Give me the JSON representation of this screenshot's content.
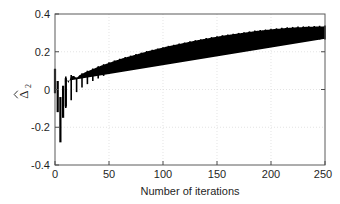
{
  "figure": {
    "background": "#ffffff",
    "plot_box": {
      "left": 55,
      "top": 14,
      "right": 325,
      "bottom": 165
    }
  },
  "chart_data": {
    "type": "line",
    "title": "",
    "subtitle": "",
    "xlabel": "Number of iterations",
    "ylabel": "Δ̂₂",
    "ylabel_base": "Δ",
    "ylabel_subscript": "2",
    "ylabel_accent": "hat",
    "xlim": [
      0,
      250
    ],
    "ylim": [
      -0.4,
      0.4
    ],
    "xticks": [
      0,
      50,
      100,
      150,
      200,
      250
    ],
    "xticklabels": [
      "0",
      "50",
      "100",
      "150",
      "200",
      "250"
    ],
    "yticks": [
      -0.4,
      -0.2,
      0,
      0.2,
      0.4
    ],
    "yticklabels": [
      "-0.4",
      "-0.2",
      "0",
      "0.2",
      "0.4"
    ],
    "grid": true,
    "grid_style": "dotted",
    "grid_color": "#d9d9d9",
    "legend": null,
    "legend_position": "none",
    "series_color": "#000000",
    "series": [
      {
        "name": "Delta-hat-2",
        "color": "#000000",
        "envelope_upper": [
          0.11,
          0.045,
          -0.04,
          0.02,
          0.06,
          0.035,
          0.07,
          0.072,
          0.06,
          0.075,
          0.082,
          0.09,
          0.096,
          0.102,
          0.108,
          0.114,
          0.12,
          0.126,
          0.131,
          0.136,
          0.141,
          0.146,
          0.151,
          0.156,
          0.16,
          0.165,
          0.169,
          0.173,
          0.177,
          0.181,
          0.185,
          0.189,
          0.193,
          0.197,
          0.201,
          0.205,
          0.208,
          0.212,
          0.215,
          0.219,
          0.222,
          0.226,
          0.229,
          0.232,
          0.235,
          0.238,
          0.241,
          0.244,
          0.247,
          0.25,
          0.253,
          0.256,
          0.259,
          0.262,
          0.264,
          0.267,
          0.27,
          0.272,
          0.275,
          0.277,
          0.28,
          0.282,
          0.285,
          0.287,
          0.289,
          0.291,
          0.293,
          0.295,
          0.297,
          0.299,
          0.301,
          0.303,
          0.305,
          0.307,
          0.309,
          0.311,
          0.312,
          0.314,
          0.315,
          0.317,
          0.318,
          0.32,
          0.321,
          0.322,
          0.324,
          0.325,
          0.326,
          0.327,
          0.328,
          0.329,
          0.33,
          0.33,
          0.331,
          0.332,
          0.332,
          0.333,
          0.333,
          0.334,
          0.334,
          0.334,
          0.335
        ],
        "envelope_lower": [
          -0.02,
          -0.12,
          -0.28,
          -0.15,
          -0.09,
          -0.11,
          -0.05,
          -0.03,
          -0.01,
          0.005,
          0.015,
          0.024,
          0.032,
          0.04,
          0.048,
          0.055,
          0.062,
          0.069,
          0.075,
          0.082,
          0.088,
          0.094,
          0.1,
          0.105,
          0.111,
          0.116,
          0.121,
          0.126,
          0.131,
          0.136,
          0.141,
          0.145,
          0.15,
          0.154,
          0.158,
          0.162,
          0.166,
          0.17,
          0.174,
          0.178,
          0.181,
          0.185,
          0.188,
          0.191,
          0.195,
          0.198,
          0.201,
          0.204,
          0.206,
          0.209,
          0.212,
          0.214,
          0.217,
          0.219,
          0.222,
          0.224,
          0.226,
          0.228,
          0.23,
          0.232,
          0.234,
          0.236,
          0.238,
          0.24,
          0.241,
          0.243,
          0.245,
          0.246,
          0.248,
          0.249,
          0.25,
          0.252,
          0.253,
          0.254,
          0.255,
          0.256,
          0.257,
          0.258,
          0.259,
          0.26,
          0.261,
          0.262,
          0.262,
          0.263,
          0.264,
          0.264,
          0.265,
          0.265,
          0.266,
          0.266,
          0.267,
          0.267,
          0.267,
          0.268,
          0.268,
          0.268,
          0.268,
          0.269,
          0.269,
          0.269
        ],
        "envelope_x": [
          0,
          2.5,
          5,
          7.5,
          10,
          12.5,
          15,
          17.5,
          20,
          22.5,
          25,
          27.5,
          30,
          32.5,
          35,
          37.5,
          40,
          42.5,
          45,
          47.5,
          50,
          52.5,
          55,
          57.5,
          60,
          62.5,
          65,
          67.5,
          70,
          72.5,
          75,
          77.5,
          80,
          82.5,
          85,
          87.5,
          90,
          92.5,
          95,
          97.5,
          100,
          102.5,
          105,
          107.5,
          110,
          112.5,
          115,
          117.5,
          120,
          122.5,
          125,
          127.5,
          130,
          132.5,
          135,
          137.5,
          140,
          142.5,
          145,
          147.5,
          150,
          152.5,
          155,
          157.5,
          160,
          162.5,
          165,
          167.5,
          170,
          172.5,
          175,
          177.5,
          180,
          182.5,
          185,
          187.5,
          190,
          192.5,
          195,
          197.5,
          200,
          202.5,
          205,
          207.5,
          210,
          212.5,
          215,
          217.5,
          220,
          222.5,
          225,
          227.5,
          230,
          232.5,
          235,
          237.5,
          240,
          242.5,
          245,
          247.5,
          250
        ],
        "final_value": 0.29,
        "min_value": -0.28,
        "max_value": 0.335,
        "oscillation_period": 5
      }
    ]
  }
}
